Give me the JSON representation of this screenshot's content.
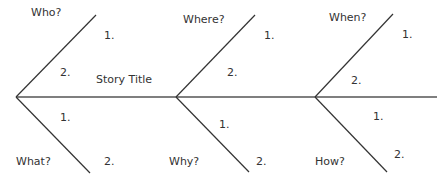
{
  "diagram": {
    "type": "fishbone",
    "title": "Story Title",
    "line_color": "#333333",
    "spine": {
      "x1": 16,
      "y1": 97,
      "x2": 437,
      "y2": 97
    },
    "branches": [
      {
        "question": "Who?",
        "position": "upper",
        "item1": "1.",
        "item2": "2."
      },
      {
        "question": "What?",
        "position": "lower",
        "item1": "1.",
        "item2": "2."
      },
      {
        "question": "Where?",
        "position": "upper",
        "item1": "1.",
        "item2": "2."
      },
      {
        "question": "Why?",
        "position": "lower",
        "item1": "1.",
        "item2": "2."
      },
      {
        "question": "When?",
        "position": "upper",
        "item1": "1.",
        "item2": "2."
      },
      {
        "question": "How?",
        "position": "lower",
        "item1": "1.",
        "item2": "2."
      }
    ]
  }
}
